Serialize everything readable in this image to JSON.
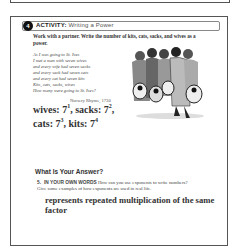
{
  "activity": {
    "number": "4",
    "label": "ACTIVITY:",
    "title": "Writing a Power",
    "instructions": "Work with a partner. Write the number of kits, cats, sacks, and wives as a power.",
    "poem": [
      "As I was going to St. Ives",
      "I met a man with seven wives",
      "and every wife had seven sacks",
      "and every sack had seven cats",
      "and every cat had seven kits",
      "Kits, cats, sacks, wives",
      "How many were going to St. Ives?"
    ],
    "attribution": "Nursery Rhyme, 1730",
    "illustration": "travelers-with-sacks-and-cats-illustration",
    "answers": {
      "line1": {
        "wives_label": "wives: 7",
        "wives_exp": "1",
        "sacks_label": ", sacks: 7",
        "sacks_exp": "2",
        "trail": ","
      },
      "line2": {
        "cats_label": "cats: 7",
        "cats_exp": "3",
        "kits_label": ", kits: 7",
        "kits_exp": "4"
      }
    }
  },
  "section": {
    "title": "What Is Your Answer?"
  },
  "question": {
    "number": "5.",
    "lead": "IN YOUR OWN WORDS",
    "text": " How can you use exponents to write numbers? Give some examples of how exponents are used in real life."
  },
  "response": "represents repeated multiplication of the same factor"
}
